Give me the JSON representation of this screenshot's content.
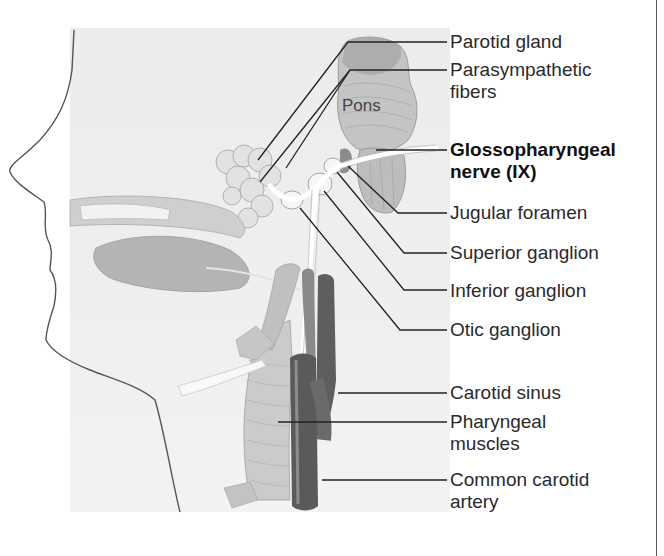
{
  "figure": {
    "subject": "Glossopharyngeal nerve (IX)",
    "structure_labels": {
      "pons": "Pons"
    },
    "labels": [
      {
        "id": "parotid-gland",
        "text": "Parotid gland",
        "bold": false
      },
      {
        "id": "parasympathetic-fibers",
        "text": "Parasympathetic\nfibers",
        "bold": false
      },
      {
        "id": "glossopharyngeal-nerve",
        "text": "Glossopharyngeal\nnerve (IX)",
        "bold": true
      },
      {
        "id": "jugular-foramen",
        "text": "Jugular foramen",
        "bold": false
      },
      {
        "id": "superior-ganglion",
        "text": "Superior ganglion",
        "bold": false
      },
      {
        "id": "inferior-ganglion",
        "text": "Inferior ganglion",
        "bold": false
      },
      {
        "id": "otic-ganglion",
        "text": "Otic ganglion",
        "bold": false
      },
      {
        "id": "carotid-sinus",
        "text": "Carotid sinus",
        "bold": false
      },
      {
        "id": "pharyngeal-muscles",
        "text": "Pharyngeal\nmuscles",
        "bold": false
      },
      {
        "id": "common-carotid-artery",
        "text": "Common carotid\nartery",
        "bold": false
      }
    ],
    "colors": {
      "background_panel": "#eeeeee",
      "leader_line": "#222222",
      "artery": "#6a6a6a",
      "muscle": "#b8b8b8",
      "nerve": "#ffffff"
    }
  }
}
